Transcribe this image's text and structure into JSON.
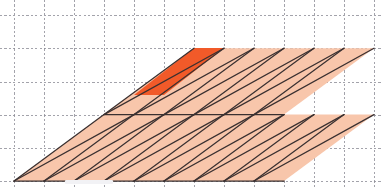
{
  "figure": {
    "width": 381,
    "height": 187,
    "background_color": "#ffffff"
  },
  "grid": {
    "label": "dashed background grid",
    "color": "#8c8c96",
    "dash": "2.2 2.2",
    "stroke_width": 0.8,
    "x_positions": [
      14,
      44,
      74,
      104,
      134,
      164,
      194,
      224,
      254,
      284,
      314,
      344,
      374
    ],
    "y_positions": [
      15,
      48,
      82,
      115,
      148,
      181
    ],
    "x_spacing": 30,
    "y_spacing": 33.2
  },
  "lattice": {
    "label": "sheared parallelogram lattice",
    "origin": [
      14,
      181
    ],
    "basis_a": [
      30,
      0
    ],
    "basis_b": [
      90,
      -66.4
    ],
    "columns": 12,
    "rows": 5,
    "cell_fill": "#f8c6ab",
    "cell_fill_highlight": "#f15a29",
    "edge_color": "#3a3030",
    "edge_width": 1.25,
    "diagonal_width": 1.25
  },
  "highlight": {
    "label": "fundamental domain",
    "cell_column": 0,
    "cell_row": 2,
    "vertices": [
      [
        134,
        95
      ],
      [
        164,
        95
      ],
      [
        224,
        48
      ],
      [
        194,
        48
      ]
    ],
    "color": "#f15a29"
  },
  "artifact": {
    "label": "page-bottom ui sliver",
    "color": "#f2f2f5"
  }
}
